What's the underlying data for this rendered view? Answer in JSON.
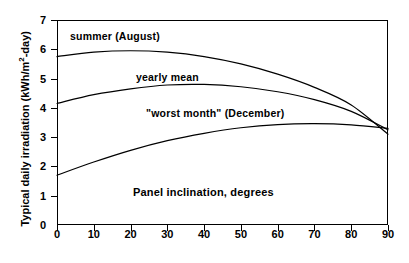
{
  "chart_data": {
    "type": "line",
    "title": "",
    "xlabel": "Panel inclination, degrees",
    "ylabel": "Typical daily irradiation (kWh/m2-day)",
    "ylabel_prefix": "Typical daily irradiation (kWh/m",
    "ylabel_superscript": "2",
    "ylabel_suffix": "-day)",
    "xlim": [
      0,
      90
    ],
    "ylim": [
      0,
      7
    ],
    "xticks": [
      0,
      10,
      20,
      30,
      40,
      50,
      60,
      70,
      80,
      90
    ],
    "yticks": [
      0,
      1,
      2,
      3,
      4,
      5,
      6,
      7
    ],
    "grid": false,
    "legend": "inline annotations",
    "line_color": "#000000",
    "background_color": "#ffffff",
    "x": [
      0,
      10,
      20,
      30,
      40,
      50,
      60,
      70,
      80,
      90
    ],
    "series": [
      {
        "name": "summer (August)",
        "annotation": "summer (August)",
        "values": [
          5.75,
          5.9,
          5.95,
          5.9,
          5.75,
          5.5,
          5.15,
          4.7,
          4.1,
          3.1
        ]
      },
      {
        "name": "yearly mean",
        "annotation": "yearly mean",
        "values": [
          4.15,
          4.45,
          4.65,
          4.78,
          4.8,
          4.72,
          4.55,
          4.28,
          3.88,
          3.25
        ]
      },
      {
        "name": "worst month (December)",
        "annotation": "\"worst month\" (December)",
        "values": [
          1.7,
          2.15,
          2.55,
          2.88,
          3.13,
          3.32,
          3.43,
          3.46,
          3.42,
          3.3
        ]
      }
    ]
  },
  "axes": {
    "y_tick_labels": [
      "7",
      "6",
      "5",
      "4",
      "3",
      "2",
      "1",
      "0"
    ],
    "x_tick_labels": [
      "0",
      "10",
      "20",
      "30",
      "40",
      "50",
      "60",
      "70",
      "80",
      "90"
    ]
  },
  "annotations": {
    "summer": "summer (August)",
    "yearly": "yearly mean",
    "worst": "\"worst month\" (December)",
    "xaxis_title": "Panel inclination, degrees"
  }
}
